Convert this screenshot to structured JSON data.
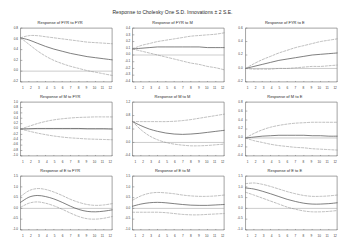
{
  "chart_data": {
    "type": "line",
    "title": "Response to Cholesky One S.D. Innovations ± 2 S.E.",
    "layout": {
      "rows": 3,
      "cols": 3
    },
    "xlabel": "",
    "ylabel": "",
    "x": [
      1,
      2,
      3,
      4,
      5,
      6,
      7,
      8,
      9,
      10,
      11,
      12
    ],
    "xticks": [
      "1",
      "2",
      "3",
      "4",
      "5",
      "6",
      "7",
      "8",
      "9",
      "10",
      "11",
      "12"
    ],
    "grid": false,
    "legend": "none",
    "zero_line": true,
    "band_style": "dashed",
    "band_label": "±2 S.E.",
    "variables": [
      "FYR",
      "M",
      "E"
    ],
    "panels": [
      {
        "title": "Response of FYR to FYR",
        "impulse": "FYR",
        "response": "FYR",
        "ylim": [
          -0.2,
          0.8
        ],
        "yticks": [
          "0.8",
          "0.6",
          "0.4",
          "0.2",
          "0.0",
          "-0.2"
        ],
        "series": [
          {
            "name": "response",
            "values": [
              0.62,
              0.58,
              0.52,
              0.46,
              0.41,
              0.37,
              0.33,
              0.3,
              0.27,
              0.25,
              0.23,
              0.21
            ]
          },
          {
            "name": "upper",
            "values": [
              0.62,
              0.66,
              0.66,
              0.64,
              0.62,
              0.6,
              0.58,
              0.56,
              0.54,
              0.53,
              0.52,
              0.51
            ]
          },
          {
            "name": "lower",
            "values": [
              0.62,
              0.5,
              0.38,
              0.28,
              0.2,
              0.14,
              0.09,
              0.05,
              0.01,
              -0.02,
              -0.05,
              -0.08
            ]
          }
        ]
      },
      {
        "title": "Response of FYR to M",
        "impulse": "M",
        "response": "FYR",
        "ylim": [
          -0.4,
          0.4
        ],
        "yticks": [
          "0.4",
          "0.3",
          "0.2",
          "0.1",
          "0.0",
          "-0.1",
          "-0.2",
          "-0.3",
          "-0.4"
        ],
        "series": [
          {
            "name": "response",
            "values": [
              0.09,
              0.1,
              0.11,
              0.12,
              0.12,
              0.12,
              0.12,
              0.12,
              0.12,
              0.11,
              0.11,
              0.11
            ]
          },
          {
            "name": "upper",
            "values": [
              0.09,
              0.14,
              0.17,
              0.2,
              0.22,
              0.24,
              0.26,
              0.28,
              0.29,
              0.3,
              0.31,
              0.33
            ]
          },
          {
            "name": "lower",
            "values": [
              0.09,
              0.06,
              0.03,
              0.0,
              -0.03,
              -0.06,
              -0.09,
              -0.12,
              -0.14,
              -0.17,
              -0.19,
              -0.22
            ]
          }
        ]
      },
      {
        "title": "Response of FYR to E",
        "impulse": "E",
        "response": "FYR",
        "ylim": [
          -0.2,
          0.6
        ],
        "yticks": [
          "0.6",
          "0.4",
          "0.2",
          "0.0",
          "-0.2"
        ],
        "series": [
          {
            "name": "response",
            "values": [
              0.0,
              0.03,
              0.06,
              0.09,
              0.12,
              0.14,
              0.16,
              0.18,
              0.2,
              0.21,
              0.22,
              0.23
            ]
          },
          {
            "name": "upper",
            "values": [
              0.0,
              0.07,
              0.13,
              0.18,
              0.23,
              0.27,
              0.31,
              0.34,
              0.37,
              0.4,
              0.42,
              0.44
            ]
          },
          {
            "name": "lower",
            "values": [
              0.0,
              -0.01,
              -0.01,
              -0.01,
              0.0,
              0.0,
              0.01,
              0.02,
              0.03,
              0.03,
              0.04,
              0.05
            ]
          }
        ]
      },
      {
        "title": "Response of M to FYR",
        "impulse": "FYR",
        "response": "M",
        "ylim": [
          -1.0,
          1.0
        ],
        "yticks": [
          "1.0",
          "0.8",
          "0.6",
          "0.4",
          "0.2",
          "0.0",
          "-0.2",
          "-0.4",
          "-0.6",
          "-0.8",
          "-1.0"
        ],
        "series": [
          {
            "name": "response",
            "values": [
              0.0,
              0.01,
              0.02,
              0.02,
              0.02,
              0.02,
              0.02,
              0.02,
              0.01,
              0.01,
              0.01,
              0.0
            ]
          },
          {
            "name": "upper",
            "values": [
              0.0,
              0.1,
              0.2,
              0.28,
              0.34,
              0.38,
              0.41,
              0.43,
              0.44,
              0.45,
              0.45,
              0.45
            ]
          },
          {
            "name": "lower",
            "values": [
              0.0,
              -0.08,
              -0.15,
              -0.21,
              -0.26,
              -0.3,
              -0.33,
              -0.35,
              -0.37,
              -0.38,
              -0.39,
              -0.4
            ]
          }
        ]
      },
      {
        "title": "Response of M to M",
        "impulse": "M",
        "response": "M",
        "ylim": [
          -0.4,
          1.2
        ],
        "yticks": [
          "1.2",
          "0.8",
          "0.4",
          "0.0",
          "-0.4"
        ],
        "series": [
          {
            "name": "response",
            "values": [
              0.62,
              0.5,
              0.4,
              0.33,
              0.28,
              0.25,
              0.24,
              0.25,
              0.27,
              0.3,
              0.33,
              0.36
            ]
          },
          {
            "name": "upper",
            "values": [
              0.62,
              0.62,
              0.62,
              0.62,
              0.62,
              0.63,
              0.65,
              0.68,
              0.72,
              0.76,
              0.8,
              0.84
            ]
          },
          {
            "name": "lower",
            "values": [
              0.62,
              0.38,
              0.2,
              0.08,
              0.0,
              -0.05,
              -0.08,
              -0.1,
              -0.1,
              -0.09,
              -0.07,
              -0.05
            ]
          }
        ]
      },
      {
        "title": "Response of M to E",
        "impulse": "E",
        "response": "M",
        "ylim": [
          -0.4,
          0.8
        ],
        "yticks": [
          "0.8",
          "0.6",
          "0.4",
          "0.2",
          "0.0",
          "-0.2",
          "-0.4"
        ],
        "series": [
          {
            "name": "response",
            "values": [
              0.0,
              0.02,
              0.04,
              0.05,
              0.06,
              0.06,
              0.06,
              0.06,
              0.05,
              0.05,
              0.04,
              0.04
            ]
          },
          {
            "name": "upper",
            "values": [
              0.0,
              0.1,
              0.18,
              0.24,
              0.28,
              0.31,
              0.33,
              0.34,
              0.35,
              0.35,
              0.35,
              0.35
            ]
          },
          {
            "name": "lower",
            "values": [
              0.0,
              -0.06,
              -0.1,
              -0.14,
              -0.17,
              -0.19,
              -0.21,
              -0.22,
              -0.24,
              -0.25,
              -0.26,
              -0.27
            ]
          }
        ]
      },
      {
        "title": "Response of E to FYR",
        "impulse": "FYR",
        "response": "E",
        "ylim": [
          -1.0,
          1.5
        ],
        "yticks": [
          "1.5",
          "1.0",
          "0.5",
          "0.0",
          "-0.5",
          "-1.0"
        ],
        "series": [
          {
            "name": "response",
            "values": [
              0.28,
              0.52,
              0.6,
              0.55,
              0.44,
              0.28,
              0.1,
              -0.05,
              -0.14,
              -0.16,
              -0.13,
              -0.07
            ]
          },
          {
            "name": "upper",
            "values": [
              0.55,
              0.82,
              0.92,
              0.88,
              0.76,
              0.6,
              0.42,
              0.28,
              0.18,
              0.14,
              0.16,
              0.22
            ]
          },
          {
            "name": "lower",
            "values": [
              0.05,
              0.24,
              0.3,
              0.24,
              0.12,
              -0.04,
              -0.22,
              -0.38,
              -0.48,
              -0.5,
              -0.46,
              -0.38
            ]
          }
        ]
      },
      {
        "title": "Response of E to M",
        "impulse": "M",
        "response": "E",
        "ylim": [
          -1.0,
          1.5
        ],
        "yticks": [
          "1.5",
          "1.0",
          "0.5",
          "0.0",
          "-0.5",
          "-1.0"
        ],
        "series": [
          {
            "name": "response",
            "values": [
              0.1,
              0.2,
              0.26,
              0.28,
              0.26,
              0.22,
              0.18,
              0.15,
              0.14,
              0.14,
              0.16,
              0.18
            ]
          },
          {
            "name": "upper",
            "values": [
              0.38,
              0.58,
              0.7,
              0.74,
              0.72,
              0.68,
              0.62,
              0.58,
              0.56,
              0.56,
              0.58,
              0.62
            ]
          },
          {
            "name": "lower",
            "values": [
              -0.18,
              -0.18,
              -0.18,
              -0.18,
              -0.2,
              -0.24,
              -0.28,
              -0.3,
              -0.3,
              -0.28,
              -0.26,
              -0.24
            ]
          }
        ]
      },
      {
        "title": "Response of E to E",
        "impulse": "E",
        "response": "E",
        "ylim": [
          -1.0,
          1.5
        ],
        "yticks": [
          "1.5",
          "1.0",
          "0.5",
          "0.0",
          "-0.5",
          "-1.0"
        ],
        "series": [
          {
            "name": "response",
            "values": [
              0.95,
              0.9,
              0.8,
              0.68,
              0.55,
              0.42,
              0.32,
              0.24,
              0.2,
              0.2,
              0.22,
              0.26
            ]
          },
          {
            "name": "upper",
            "values": [
              1.15,
              1.18,
              1.12,
              1.02,
              0.9,
              0.78,
              0.68,
              0.6,
              0.56,
              0.56,
              0.58,
              0.62
            ]
          },
          {
            "name": "lower",
            "values": [
              0.75,
              0.62,
              0.48,
              0.34,
              0.2,
              0.06,
              -0.04,
              -0.12,
              -0.16,
              -0.16,
              -0.14,
              -0.1
            ]
          }
        ]
      }
    ]
  },
  "style": {
    "line_color": "#555555",
    "band_color": "#888888",
    "axis_color": "#666666",
    "zero_color": "#999999",
    "background": "#ffffff"
  }
}
